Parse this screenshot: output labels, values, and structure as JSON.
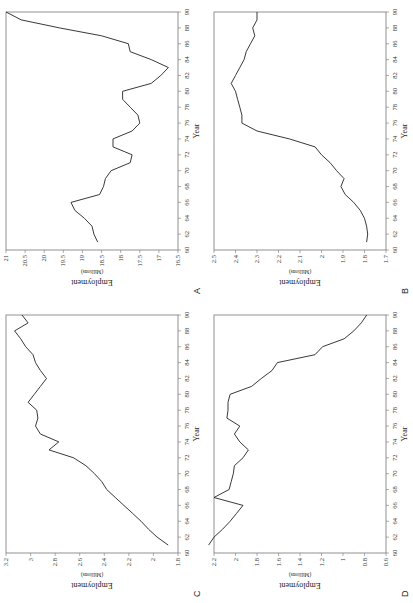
{
  "chart_data": [
    {
      "panel": "A",
      "type": "line",
      "xlabel": "Year",
      "ylabel": "Employment",
      "ylabel_sub": "(Millions)",
      "xlim": [
        60,
        90
      ],
      "ylim": [
        16.5,
        21
      ],
      "xticks": [
        60,
        62,
        64,
        66,
        68,
        70,
        72,
        74,
        76,
        78,
        80,
        82,
        84,
        86,
        88,
        90
      ],
      "yticks": [
        16.5,
        17,
        17.5,
        18,
        18.5,
        19,
        19.5,
        20,
        20.5,
        21
      ],
      "x": [
        61,
        62,
        63,
        64,
        65,
        66,
        67,
        68,
        69,
        70,
        71,
        72,
        73,
        74,
        75,
        76,
        77,
        78,
        79,
        80,
        81,
        82,
        83,
        84,
        85,
        86,
        87,
        88,
        89,
        90
      ],
      "values": [
        18.6,
        18.7,
        18.75,
        18.95,
        19.2,
        19.3,
        18.55,
        18.45,
        18.4,
        18.25,
        17.75,
        17.7,
        18.2,
        18.2,
        17.7,
        17.5,
        17.55,
        17.75,
        17.95,
        17.95,
        17.2,
        16.95,
        16.75,
        17.2,
        17.75,
        17.8,
        18.5,
        19.6,
        20.6,
        21.0
      ]
    },
    {
      "panel": "B",
      "type": "line",
      "xlabel": "Year",
      "ylabel": "Employment",
      "ylabel_sub": "(Millions)",
      "xlim": [
        60,
        90
      ],
      "ylim": [
        1.7,
        2.5
      ],
      "xticks": [
        60,
        62,
        64,
        66,
        68,
        70,
        72,
        74,
        76,
        78,
        80,
        82,
        84,
        86,
        88,
        90
      ],
      "yticks": [
        1.7,
        1.8,
        1.9,
        2,
        2.1,
        2.2,
        2.3,
        2.4,
        2.5
      ],
      "x": [
        61,
        62,
        63,
        64,
        65,
        66,
        67,
        68,
        69,
        70,
        71,
        72,
        73,
        74,
        75,
        76,
        77,
        78,
        79,
        80,
        81,
        82,
        83,
        84,
        85,
        86,
        87,
        88,
        89,
        90
      ],
      "values": [
        1.79,
        1.785,
        1.79,
        1.8,
        1.82,
        1.85,
        1.89,
        1.91,
        1.895,
        1.93,
        1.96,
        2.0,
        2.03,
        2.15,
        2.3,
        2.37,
        2.37,
        2.38,
        2.39,
        2.4,
        2.42,
        2.4,
        2.38,
        2.36,
        2.35,
        2.33,
        2.31,
        2.32,
        2.3,
        2.3
      ]
    },
    {
      "panel": "C",
      "type": "line",
      "xlabel": "Year",
      "ylabel": "Employment",
      "ylabel_sub": "(Millions)",
      "xlim": [
        60,
        90
      ],
      "ylim": [
        1.8,
        3.2
      ],
      "xticks": [
        60,
        62,
        64,
        66,
        68,
        70,
        72,
        74,
        76,
        78,
        80,
        82,
        84,
        86,
        88,
        90
      ],
      "yticks": [
        1.8,
        2,
        2.2,
        2.4,
        2.6,
        2.8,
        3,
        3.2
      ],
      "x": [
        61,
        62,
        63,
        64,
        65,
        66,
        67,
        68,
        69,
        70,
        71,
        72,
        73,
        74,
        75,
        76,
        77,
        78,
        79,
        80,
        81,
        82,
        83,
        84,
        85,
        86,
        87,
        88,
        89,
        90
      ],
      "values": [
        1.88,
        1.97,
        2.04,
        2.1,
        2.17,
        2.24,
        2.31,
        2.38,
        2.42,
        2.48,
        2.55,
        2.65,
        2.85,
        2.77,
        2.92,
        2.96,
        2.94,
        2.95,
        3.02,
        2.97,
        2.92,
        2.87,
        2.92,
        2.96,
        2.98,
        3.04,
        3.08,
        3.13,
        3.02,
        3.07
      ]
    },
    {
      "panel": "D",
      "type": "line",
      "xlabel": "Year",
      "ylabel": "Employment",
      "ylabel_sub": "(Millions)",
      "xlim": [
        60,
        90
      ],
      "ylim": [
        0.6,
        2.2
      ],
      "xticks": [
        60,
        62,
        64,
        66,
        68,
        70,
        72,
        74,
        76,
        78,
        80,
        82,
        84,
        86,
        88,
        90
      ],
      "yticks": [
        0.6,
        0.8,
        1,
        1.2,
        1.4,
        1.6,
        1.8,
        2,
        2.2
      ],
      "x": [
        61,
        62,
        63,
        64,
        65,
        66,
        67,
        68,
        69,
        70,
        71,
        72,
        73,
        74,
        75,
        76,
        77,
        78,
        79,
        80,
        81,
        82,
        83,
        84,
        85,
        86,
        87,
        88,
        89,
        90
      ],
      "values": [
        2.25,
        2.2,
        2.12,
        2.05,
        1.99,
        1.93,
        2.2,
        2.06,
        2.04,
        2.02,
        2.01,
        1.93,
        1.88,
        1.96,
        2.01,
        1.96,
        2.08,
        2.07,
        2.07,
        2.05,
        1.85,
        1.76,
        1.66,
        1.61,
        1.26,
        1.19,
        0.99,
        0.9,
        0.83,
        0.78
      ]
    }
  ]
}
